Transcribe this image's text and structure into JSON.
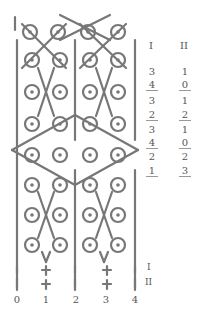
{
  "figure": {
    "stroke_color": "#777777",
    "columns": [
      "0",
      "1",
      "2",
      "3",
      "4"
    ],
    "row_markers": [
      "I",
      "II"
    ]
  },
  "table": {
    "headers": [
      "I",
      "II"
    ],
    "rows": [
      {
        "I": "3",
        "II": "1",
        "underlined": false
      },
      {
        "I": "4",
        "II": "0",
        "underlined": true
      },
      {
        "I": "3",
        "II": "1",
        "underlined": false
      },
      {
        "I": "2",
        "II": "2",
        "underlined": true
      },
      {
        "I": "3",
        "II": "1",
        "underlined": false
      },
      {
        "I": "4",
        "II": "0",
        "underlined": true
      },
      {
        "I": "2",
        "II": "2",
        "underlined": false
      },
      {
        "I": "1",
        "II": "3",
        "underlined": true
      }
    ]
  }
}
